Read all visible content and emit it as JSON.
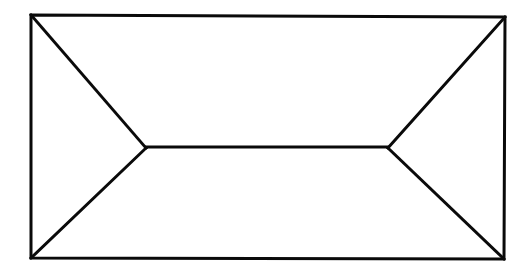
{
  "figure": {
    "background_color": "#ffffff",
    "stroke_color": "#0a0a0a",
    "stroke_width": 3,
    "canvas": {
      "width": 528,
      "height": 277
    },
    "vertices": {
      "rect_top_left": {
        "x": 31,
        "y": 15
      },
      "rect_top_right": {
        "x": 505,
        "y": 17
      },
      "rect_bottom_right": {
        "x": 504,
        "y": 259
      },
      "rect_bottom_left": {
        "x": 31,
        "y": 258
      },
      "left_apex": {
        "x": 146,
        "y": 148
      },
      "right_apex": {
        "x": 388,
        "y": 148
      }
    },
    "paths": {
      "rectangle": "M 31,15 L 505,17 L 504,259 L 31,258 Z",
      "left_triangle_upper": "M 31,15 L 146,148",
      "left_triangle_lower": "M 146,148 L 31,258",
      "right_triangle_upper": "M 505,17 L 388,148",
      "right_triangle_lower": "M 388,148 L 504,259",
      "center_bar": "M 146,147 L 388,147"
    },
    "segment_labels": {
      "rectangle": "outer-rectangle",
      "left_triangle_upper": "left-triangle-upper-edge",
      "left_triangle_lower": "left-triangle-lower-edge",
      "right_triangle_upper": "right-triangle-upper-edge",
      "right_triangle_lower": "right-triangle-lower-edge",
      "center_bar": "center-horizontal-bar"
    }
  }
}
